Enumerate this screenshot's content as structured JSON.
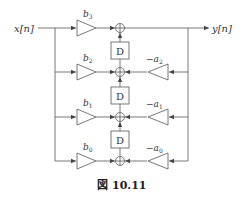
{
  "diagram": {
    "type": "signal-flow-block-diagram",
    "input_label": "x[n]",
    "output_label": "y[n]",
    "delay_label": "D",
    "feedforward_gains": [
      "b3",
      "b2",
      "b1",
      "b0"
    ],
    "feedforward_gain_display": [
      {
        "base": "b",
        "sub": "3"
      },
      {
        "base": "b",
        "sub": "2"
      },
      {
        "base": "b",
        "sub": "1"
      },
      {
        "base": "b",
        "sub": "0"
      }
    ],
    "feedback_gains": [
      "-a2",
      "-a1",
      "-a0"
    ],
    "feedback_gain_display": [
      {
        "base": "−a",
        "sub": "2"
      },
      {
        "base": "−a",
        "sub": "1"
      },
      {
        "base": "−a",
        "sub": "0"
      }
    ],
    "num_delays": 3,
    "num_adders": 4
  },
  "caption": {
    "symbol": "図",
    "number": "10.11"
  },
  "colors": {
    "line": "#555555",
    "text": "#333333",
    "background": "#ffffff"
  }
}
